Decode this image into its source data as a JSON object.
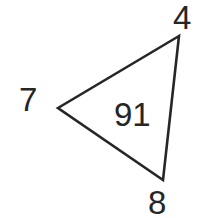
{
  "figure": {
    "type": "triangle-with-labels",
    "background_color": "#ffffff",
    "stroke_color": "#262626",
    "stroke_width": 2.6,
    "text_color": "#262626",
    "vertices": {
      "top": {
        "x": 179,
        "y": 36
      },
      "left": {
        "x": 58,
        "y": 108
      },
      "bottom": {
        "x": 163,
        "y": 180
      }
    },
    "labels": {
      "vertex_top": "4",
      "vertex_left": "7",
      "vertex_bottom": "8",
      "interior_angle": "91"
    }
  }
}
